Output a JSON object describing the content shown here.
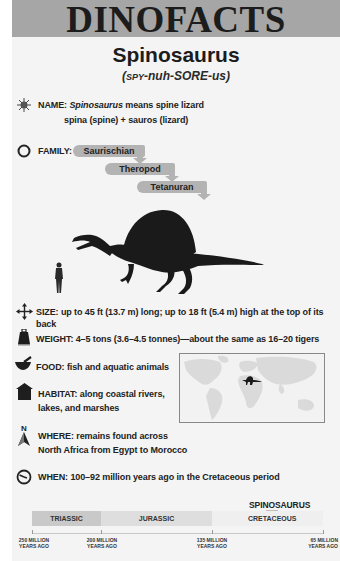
{
  "header": {
    "masthead": "DINOFACTS",
    "title": "Spinosaurus",
    "pronunciation_prefix": "(",
    "pronunciation_smallcaps": "SPY",
    "pronunciation_rest": "-nuh-SORE-us)"
  },
  "facts": {
    "name": {
      "icon": "starburst-icon",
      "label": "NAME:",
      "species": "Spinosaurus",
      "meaning": " means spine lizard",
      "etymology": "spina (spine) + sauros (lizard)"
    },
    "family": {
      "icon": "circle-icon",
      "label": "FAMILY:",
      "levels": [
        "Saurischian",
        "Theropod",
        "Tetanuran"
      ]
    },
    "size": {
      "icon": "four-way-arrows-icon",
      "text": "SIZE: up to 45 ft (13.7 m) long; up to 18 ft (5.4 m) high at the top of its back"
    },
    "weight": {
      "icon": "weight-icon",
      "text": "WEIGHT: 4–5 tons (3.6–4.5 tonnes)—about the same as 16–20 tigers"
    },
    "food": {
      "icon": "mortar-pestle-icon",
      "text": "FOOD: fish and aquatic animals"
    },
    "habitat": {
      "icon": "house-icon",
      "line1": "HABITAT: along coastal rivers,",
      "line2": "lakes, and marshes"
    },
    "where": {
      "icon": "north-compass-icon",
      "compass_letter": "N",
      "line1": "WHERE: remains found across",
      "line2": "North Africa from Egypt to Morocco"
    },
    "when": {
      "icon": "clock-icon",
      "text": "WHEN: 100–92 million years ago in the Cretaceous period"
    }
  },
  "illustration": {
    "subject": "spinosaurus-silhouette",
    "scale_reference": "human-silhouette"
  },
  "map": {
    "type": "world-map",
    "marker": "spinosaurus-marker-north-africa"
  },
  "timeline": {
    "marker_label": "SPINOSAURUS",
    "periods": [
      {
        "name": "TRIASSIC",
        "color": "#c9c9c9"
      },
      {
        "name": "JURASSIC",
        "color": "#dedede"
      },
      {
        "name": "CRETACEOUS",
        "color": "#f0f0f0"
      }
    ],
    "ticks": [
      {
        "line1": "250 MILLION",
        "line2": "YEARS AGO"
      },
      {
        "line1": "200 MILLION",
        "line2": "YEARS AGO"
      },
      {
        "line1": "135 MILLION",
        "line2": "YEARS AGO"
      },
      {
        "line1": "65 MILLION",
        "line2": "YEARS AGO"
      }
    ]
  },
  "colors": {
    "header_band": "#a6a6a6",
    "panel": "#f4f4f4",
    "family_bar": "#b3b3b3",
    "text": "#1c1c1c"
  }
}
